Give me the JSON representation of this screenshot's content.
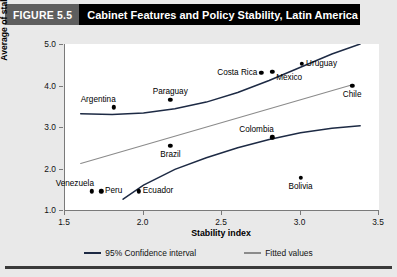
{
  "header": {
    "figure_number": "FIGURE 5.5",
    "title": "Cabinet Features and Policy Stability, Latin America"
  },
  "colors": {
    "panel_background": "#e9e9e9",
    "plot_background": "#ffffff",
    "confidence_interval": "#1d2a44",
    "fitted_values": "#8b8b8b",
    "point": "#000000",
    "axis": "#7a7a7a",
    "header_band": "#000000",
    "figure_number_band": "#5e5e5e"
  },
  "legend": {
    "position": "bottom-center",
    "items": [
      {
        "label": "95% Confidence interval",
        "color": "#1d2a44"
      },
      {
        "label": "Fitted values",
        "color": "#8b8b8b"
      }
    ]
  },
  "chart_data": {
    "type": "scatter",
    "title": "Cabinet Features and Policy Stability, Latin America",
    "xlabel": "Stability index",
    "ylabel": "Average of stability measures",
    "xlim": [
      1.5,
      3.5
    ],
    "ylim": [
      1.0,
      5.0
    ],
    "xticks": [
      1.5,
      2.0,
      2.5,
      3.0,
      3.5
    ],
    "xtick_labels": [
      "1.5",
      "2.0",
      "2.5",
      "3.0",
      "3.5"
    ],
    "yticks": [
      1.0,
      2.0,
      3.0,
      4.0,
      5.0
    ],
    "ytick_labels": [
      "1.0",
      "2.0",
      "3.0",
      "4.0",
      "5.0"
    ],
    "grid": false,
    "points": [
      {
        "label": "Venezuela",
        "x": 1.67,
        "y": 1.45,
        "label_pos": "above-left"
      },
      {
        "label": "Peru",
        "x": 1.73,
        "y": 1.45,
        "label_pos": "right"
      },
      {
        "label": "Ecuador",
        "x": 1.97,
        "y": 1.45,
        "label_pos": "right"
      },
      {
        "label": "Argentina",
        "x": 1.81,
        "y": 3.47,
        "label_pos": "above-left"
      },
      {
        "label": "Paraguay",
        "x": 2.17,
        "y": 3.65,
        "label_pos": "above"
      },
      {
        "label": "Brazil",
        "x": 2.17,
        "y": 2.55,
        "label_pos": "below"
      },
      {
        "label": "Colombia",
        "x": 2.82,
        "y": 2.75,
        "label_pos": "above-left"
      },
      {
        "label": "Costa Rica",
        "x": 2.75,
        "y": 4.3,
        "label_pos": "left"
      },
      {
        "label": "Mexico",
        "x": 2.82,
        "y": 4.33,
        "label_pos": "right-below"
      },
      {
        "label": "Uruguay",
        "x": 3.01,
        "y": 4.53,
        "label_pos": "right"
      },
      {
        "label": "Chile",
        "x": 3.33,
        "y": 4.0,
        "label_pos": "below"
      },
      {
        "label": "Bolivia",
        "x": 3.0,
        "y": 1.78,
        "label_pos": "below"
      }
    ],
    "series": [
      {
        "name": "95% Confidence interval",
        "type": "line",
        "color": "#1d2a44",
        "role": "upper-bound",
        "x": [
          1.6,
          1.8,
          2.0,
          2.2,
          2.4,
          2.6,
          2.8,
          3.0,
          3.2,
          3.38
        ],
        "y": [
          3.32,
          3.3,
          3.34,
          3.44,
          3.6,
          3.83,
          4.12,
          4.44,
          4.76,
          5.0
        ]
      },
      {
        "name": "95% Confidence interval",
        "type": "line",
        "color": "#1d2a44",
        "role": "lower-bound",
        "x": [
          1.87,
          2.0,
          2.2,
          2.4,
          2.6,
          2.8,
          3.0,
          3.2,
          3.38
        ],
        "y": [
          1.26,
          1.6,
          1.98,
          2.26,
          2.5,
          2.7,
          2.86,
          2.97,
          3.03
        ]
      },
      {
        "name": "Fitted values",
        "type": "line",
        "color": "#8b8b8b",
        "x": [
          1.6,
          3.33
        ],
        "y": [
          2.12,
          4.02
        ]
      }
    ]
  }
}
